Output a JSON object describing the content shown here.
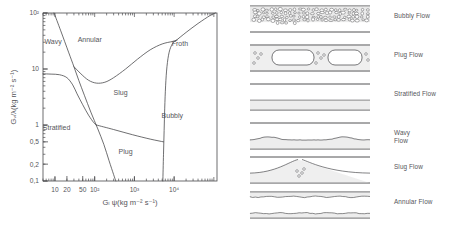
{
  "chart_data": {
    "type": "line",
    "title": "",
    "xlabel": "Gₗ ψ(kg m⁻² s⁻¹)",
    "ylabel": "Gᵥ/λ(kg m⁻² s⁻¹)",
    "xscale": "log",
    "yscale": "log",
    "xlim": [
      5,
      120000
    ],
    "ylim": [
      0.1,
      100
    ],
    "grid": false,
    "legend": "none",
    "xticks": [
      {
        "value": 10,
        "label": "10"
      },
      {
        "value": 20,
        "label": "20"
      },
      {
        "value": 50,
        "label": "50"
      },
      {
        "value": 100,
        "label": "10²"
      },
      {
        "value": 1000,
        "label": "10³"
      },
      {
        "value": 10000,
        "label": "10⁴"
      }
    ],
    "yticks": [
      {
        "value": 0.1,
        "label": "0,1"
      },
      {
        "value": 0.2,
        "label": "0,2"
      },
      {
        "value": 0.5,
        "label": "0,5"
      },
      {
        "value": 1,
        "label": "1"
      },
      {
        "value": 10,
        "label": "10"
      },
      {
        "value": 100,
        "label": "10²"
      }
    ],
    "region_labels": [
      {
        "name": "wavy",
        "text": "Wavy",
        "x": 9,
        "y": 28
      },
      {
        "name": "annular",
        "text": "Annular",
        "x": 75,
        "y": 30
      },
      {
        "name": "froth",
        "text": "Froth",
        "x": 14000,
        "y": 26
      },
      {
        "name": "slug",
        "text": "Slug",
        "x": 450,
        "y": 3.4
      },
      {
        "name": "bubbly",
        "text": "Bubbly",
        "x": 9000,
        "y": 1.35
      },
      {
        "name": "stratified",
        "text": "Stratified",
        "x": 11,
        "y": 0.82
      },
      {
        "name": "plug",
        "text": "Plug",
        "x": 600,
        "y": 0.3
      }
    ],
    "boundaries": [
      {
        "name": "wavy-annular-boundary",
        "comment": "steep line from top-left descending to lower right",
        "points": [
          [
            9.5,
            100
          ],
          [
            14,
            48
          ],
          [
            22,
            20
          ],
          [
            30,
            11
          ],
          [
            40,
            6.2
          ],
          [
            55,
            3.4
          ],
          [
            80,
            1.7
          ],
          [
            120,
            0.85
          ],
          [
            170,
            0.45
          ],
          [
            230,
            0.23
          ],
          [
            300,
            0.13
          ],
          [
            340,
            0.1
          ]
        ]
      },
      {
        "name": "stratified-upper-boundary",
        "comment": "near-flat then falling curve",
        "points": [
          [
            5,
            8.2
          ],
          [
            8,
            8.1
          ],
          [
            13,
            7.9
          ],
          [
            20,
            7.0
          ],
          [
            28,
            5.2
          ],
          [
            36,
            3.6
          ],
          [
            50,
            2.3
          ],
          [
            70,
            1.5
          ],
          [
            95,
            1.1
          ],
          [
            110,
            1.0
          ]
        ]
      },
      {
        "name": "annular-slug-boundary",
        "comment": "U shaped dip under Annular",
        "points": [
          [
            30,
            11
          ],
          [
            45,
            8.2
          ],
          [
            70,
            6.3
          ],
          [
            110,
            5.6
          ],
          [
            180,
            5.8
          ],
          [
            300,
            7.0
          ],
          [
            600,
            10
          ],
          [
            1200,
            15
          ],
          [
            2500,
            22
          ],
          [
            5000,
            28
          ],
          [
            9000,
            31
          ],
          [
            12000,
            33
          ]
        ]
      },
      {
        "name": "bubbly-froth-boundary",
        "comment": "near-vertical right boundary",
        "points": [
          [
            5200,
            0.1
          ],
          [
            5400,
            0.3
          ],
          [
            5600,
            0.8
          ],
          [
            5800,
            2.0
          ],
          [
            6100,
            5
          ],
          [
            6600,
            11
          ],
          [
            7500,
            20
          ],
          [
            9000,
            28
          ],
          [
            11000,
            32
          ]
        ]
      },
      {
        "name": "froth-upper-boundary",
        "comment": "curve rising to top-right corner",
        "points": [
          [
            11000,
            32
          ],
          [
            20000,
            45
          ],
          [
            40000,
            65
          ],
          [
            80000,
            90
          ],
          [
            110000,
            100
          ]
        ]
      },
      {
        "name": "plug-slug-boundary",
        "comment": "gently falling line to the right",
        "points": [
          [
            110,
            1.0
          ],
          [
            300,
            0.83
          ],
          [
            900,
            0.67
          ],
          [
            2500,
            0.56
          ],
          [
            5400,
            0.5
          ]
        ]
      }
    ]
  },
  "diagram": {
    "rows": [
      {
        "id": "bubbly",
        "label": "Bubbly Flow",
        "pattern": "bubbly"
      },
      {
        "id": "plug",
        "label": "Plug Flow",
        "pattern": "plug"
      },
      {
        "id": "stratified",
        "label": "Stratified Flow",
        "pattern": "stratified"
      },
      {
        "id": "wavy",
        "label": "Wavy\nFlow",
        "pattern": "wavy"
      },
      {
        "id": "slug",
        "label": "Slug Flow",
        "pattern": "slug"
      },
      {
        "id": "annular",
        "label": "Annular Flow",
        "pattern": "annular"
      }
    ]
  },
  "colors": {
    "ink": "#3f3f42",
    "text": "#55555a",
    "axis": "#4a4a4d",
    "fill": "#d8d8d8",
    "background": "#ffffff"
  }
}
